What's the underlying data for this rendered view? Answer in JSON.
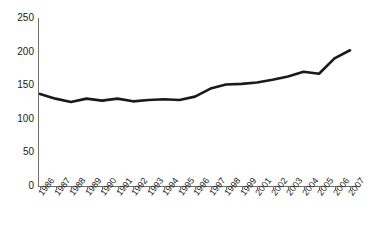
{
  "chart_data": {
    "type": "line",
    "title": "",
    "subtitle": "",
    "xlabel": "",
    "ylabel": "",
    "grid": false,
    "legend": "none",
    "x": [
      "1986",
      "1987",
      "1988",
      "1989",
      "1990",
      "1991",
      "1992",
      "1993",
      "1994",
      "1995",
      "1996",
      "1997",
      "1998",
      "1999",
      "2001",
      "2002",
      "2003",
      "2004",
      "2005",
      "2006",
      "2007"
    ],
    "categories": [
      "1986",
      "1987",
      "1988",
      "1989",
      "1990",
      "1991",
      "1992",
      "1993",
      "1994",
      "1995",
      "1996",
      "1997",
      "1998",
      "1999",
      "2001",
      "2002",
      "2003",
      "2004",
      "2005",
      "2006",
      "2007"
    ],
    "values": [
      137,
      130,
      125,
      130,
      127,
      130,
      126,
      128,
      129,
      128,
      133,
      145,
      151,
      152,
      154,
      158,
      163,
      170,
      167,
      190,
      202
    ],
    "series": [
      {
        "name": "series-1",
        "values": [
          137,
          130,
          125,
          130,
          127,
          130,
          126,
          128,
          129,
          128,
          133,
          145,
          151,
          152,
          154,
          158,
          163,
          170,
          167,
          190,
          202
        ]
      }
    ],
    "ylim": [
      0,
      250
    ],
    "y_ticks": [
      0,
      50,
      100,
      150,
      200,
      250
    ],
    "y_tick_labels": [
      "0",
      "50",
      "100",
      "150",
      "200",
      "250"
    ],
    "x_tick_labels": [
      "1986",
      "1987",
      "1988",
      "1989",
      "1990",
      "1991",
      "1992",
      "1993",
      "1994",
      "1995",
      "1996",
      "1997",
      "1998",
      "1999",
      "2001",
      "2002",
      "2003",
      "2004",
      "2005",
      "2006",
      "2007"
    ],
    "line_color": "#1a1a1a",
    "axis_color": "#6e6e6e",
    "background_color": "#ffffff",
    "line_width": 2.6
  }
}
